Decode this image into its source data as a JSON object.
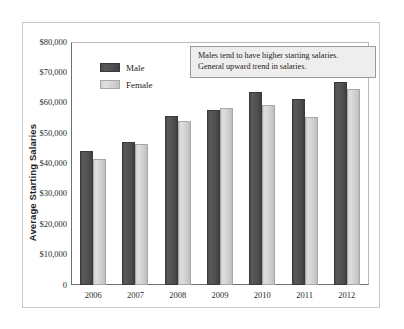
{
  "chart_data": {
    "type": "bar",
    "title": "",
    "subtitle": "",
    "xlabel": "",
    "ylabel": "Average Starting Salaries",
    "categories": [
      "2006",
      "2007",
      "2008",
      "2009",
      "2010",
      "2011",
      "2012"
    ],
    "series": [
      {
        "name": "Male",
        "color": "#4d4d4d",
        "values": [
          44000,
          47000,
          55600,
          57700,
          63400,
          61200,
          67000
        ]
      },
      {
        "name": "Female",
        "color": "#cfcfcf",
        "values": [
          41500,
          46400,
          54000,
          58400,
          59200,
          55200,
          64500
        ]
      }
    ],
    "ylim": [
      0,
      80000
    ],
    "ytick_values": [
      80000,
      70000,
      60000,
      50000,
      40000,
      30000,
      20000,
      10000,
      0
    ],
    "ytick_labels": [
      "$80,000",
      "$70,000",
      "$60,000",
      "$50,000",
      "$40,000",
      "$30,000",
      "$20,000",
      "$10,000",
      "0"
    ],
    "grid": false,
    "legend_position": "upper-left-inside",
    "annotations": [
      "Males tend to have higher starting salaries.",
      "General upward trend in salaries."
    ]
  },
  "legend": {
    "items": [
      {
        "label": "Male",
        "swatch": "male"
      },
      {
        "label": "Female",
        "swatch": "female"
      }
    ]
  },
  "axis": {
    "y_title": "Average Starting Salaries"
  },
  "colors": {
    "male_bar": "#4d4d4d",
    "female_bar": "#cfcfcf",
    "axis_line": "#6f6f6f",
    "frame_border": "#c9c9c9",
    "annotation_bg": "#eeeeee",
    "annotation_border": "#9a9a9a",
    "background": "#ffffff"
  }
}
